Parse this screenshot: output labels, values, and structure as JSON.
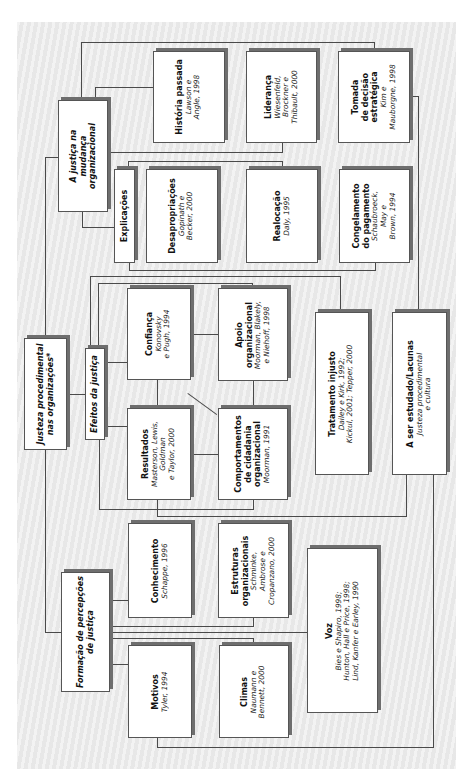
{
  "diagram": {
    "root": {
      "title_lines": [
        "Justeza procedimental",
        "nas organizações*"
      ]
    },
    "branches": {
      "mudanca": {
        "title_lines": [
          "A justiça na",
          "mudança",
          "organizacional"
        ],
        "children": {
          "historia": {
            "title": "História passada",
            "cite_lines": [
              "Lawson e",
              "Angle, 1998"
            ]
          },
          "lideranca": {
            "title": "Liderança",
            "cite_lines": [
              "Wiesenfeld,",
              "Brockner e",
              "Thibault, 2000"
            ]
          },
          "tomada": {
            "title_lines": [
              "Tomada",
              "de decisão",
              "estratégica"
            ],
            "cite_lines": [
              "Kim e",
              "Mauborgne, 1998"
            ]
          },
          "explicacoes": {
            "title": "Explicações"
          },
          "desapropriacoes": {
            "title": "Desapropriações",
            "cite_lines": [
              "Gopinath e",
              "Becker, 2000"
            ]
          },
          "realocacao": {
            "title": "Realocação",
            "cite_lines": [
              "Daly, 1995"
            ]
          },
          "congelamento": {
            "title_lines": [
              "Congelamento",
              "do pagamento"
            ],
            "cite_lines": [
              "Schaubroeck,",
              "May e",
              "Brown, 1994"
            ]
          }
        }
      },
      "efeitos": {
        "title": "Efeitos da justiça",
        "children": {
          "confianca": {
            "title": "Confiança",
            "cite_lines": [
              "Konovsky",
              "e Pugh, 1994"
            ]
          },
          "apoio": {
            "title_lines": [
              "Apoio",
              "organizacional"
            ],
            "cite_lines": [
              "Moorman, Blakely,",
              "e Niehoff, 1998"
            ]
          },
          "resultados": {
            "title": "Resultados",
            "cite_lines": [
              "Masterson, Lewis,",
              "Goldman",
              "e Taylor, 2000"
            ]
          },
          "comportamentos": {
            "title_lines": [
              "Comportamentos",
              "de cidadania",
              "organizacional"
            ],
            "cite_lines": [
              "Moorman, 1991"
            ]
          },
          "tratamento": {
            "title": "Tratamento injusto",
            "cite_lines": [
              "Dailey e Kirk, 1992;",
              "Kickul, 2001; Tepper, 2000"
            ]
          },
          "estudado": {
            "title": "A ser estudado/Lacunas",
            "cite_lines": [
              "Justeza procedimental",
              "e cultura"
            ]
          }
        }
      },
      "formacao": {
        "title_lines": [
          "Formação de percepções",
          "de justiça"
        ],
        "children": {
          "conhecimento": {
            "title": "Conhecimento",
            "cite_lines": [
              "Schappe, 1996"
            ]
          },
          "estruturas": {
            "title_lines": [
              "Estruturas",
              "organizacionais"
            ],
            "cite_lines": [
              "Schminke,",
              "Ambrose e",
              "Cropanzano, 2000"
            ]
          },
          "motivos": {
            "title": "Motivos",
            "cite_lines": [
              "Tyler, 1994"
            ]
          },
          "climas": {
            "title": "Climas",
            "cite_lines": [
              "Naumann e",
              "Bennett, 2000"
            ]
          },
          "voz": {
            "title": "Voz",
            "cite_lines": [
              "Bies e Shapiro, 1998;",
              "Hunton, Hall e Price, 1998;",
              "Lind, Kanfer e Earley, 1990"
            ]
          }
        }
      }
    },
    "colors": {
      "background": "#ececec",
      "box": "#ffffff",
      "line": "#4a4a4a",
      "shadow": "#6e6e6e"
    }
  }
}
